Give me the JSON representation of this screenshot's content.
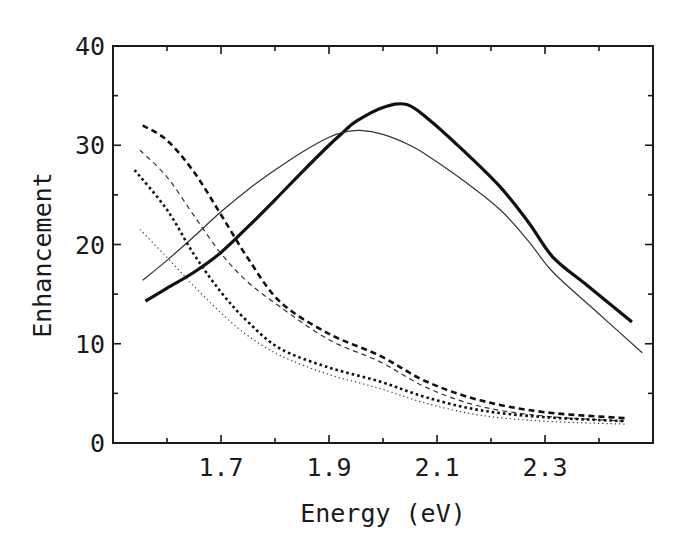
{
  "chart_data": {
    "type": "line",
    "title": "",
    "xlabel": "Energy (eV)",
    "ylabel": "Enhancement",
    "xlim": [
      1.5,
      2.5
    ],
    "ylim": [
      0,
      40
    ],
    "x_ticks_major": [
      1.7,
      1.9,
      2.1,
      2.3
    ],
    "x_tick_labels": [
      "1.7",
      "1.9",
      "2.1",
      "2.3"
    ],
    "x_ticks_minor": [
      1.6,
      1.8,
      2.0,
      2.2,
      2.4
    ],
    "y_ticks_major": [
      0,
      10,
      20,
      30,
      40
    ],
    "y_tick_labels": [
      "0",
      "10",
      "20",
      "30",
      "40"
    ],
    "y_ticks_minor": [
      5,
      15,
      25,
      35
    ],
    "grid": false,
    "legend": null,
    "series": [
      {
        "name": "thick solid",
        "style": "solid",
        "width": 3.2,
        "color": "#111111",
        "x": [
          1.56,
          1.6,
          1.65,
          1.7,
          1.754,
          1.8,
          1.85,
          1.9,
          1.926,
          1.95,
          2.0,
          2.044,
          2.087,
          2.15,
          2.217,
          2.27,
          2.315,
          2.38,
          2.461
        ],
        "y": [
          14.3,
          15.6,
          17.2,
          19.2,
          22.0,
          24.5,
          27.3,
          30.0,
          31.3,
          32.4,
          33.8,
          34.1,
          32.5,
          29.4,
          25.8,
          22.2,
          18.7,
          15.8,
          12.2
        ]
      },
      {
        "name": "thin solid",
        "style": "solid",
        "width": 1.2,
        "color": "#333333",
        "x": [
          1.555,
          1.6,
          1.65,
          1.7,
          1.754,
          1.8,
          1.85,
          1.9,
          1.926,
          1.957,
          2.0,
          2.05,
          2.087,
          2.15,
          2.217,
          2.27,
          2.315,
          2.4,
          2.48
        ],
        "y": [
          16.4,
          18.4,
          20.8,
          23.3,
          25.7,
          27.5,
          29.3,
          30.8,
          31.3,
          31.5,
          31.1,
          30.0,
          28.8,
          26.4,
          23.5,
          20.3,
          17.2,
          13.0,
          9.1
        ]
      },
      {
        "name": "thick dashed",
        "style": "dashed",
        "width": 2.6,
        "color": "#111111",
        "x": [
          1.555,
          1.6,
          1.65,
          1.7,
          1.75,
          1.81,
          1.9,
          1.994,
          2.08,
          2.18,
          2.3,
          2.45
        ],
        "y": [
          32.0,
          30.5,
          27.3,
          23.0,
          18.6,
          14.2,
          11.0,
          8.8,
          6.2,
          4.3,
          3.1,
          2.5
        ]
      },
      {
        "name": "thin dashed",
        "style": "dashed",
        "width": 1.2,
        "color": "#333333",
        "x": [
          1.55,
          1.6,
          1.65,
          1.7,
          1.75,
          1.81,
          1.9,
          1.994,
          2.08,
          2.18,
          2.3,
          2.45
        ],
        "y": [
          29.5,
          26.8,
          22.9,
          19.1,
          16.2,
          13.7,
          10.4,
          8.2,
          5.6,
          3.7,
          2.7,
          2.2
        ]
      },
      {
        "name": "thick dotted",
        "style": "dotted",
        "width": 2.6,
        "color": "#111111",
        "x": [
          1.54,
          1.6,
          1.65,
          1.7,
          1.75,
          1.81,
          1.9,
          1.994,
          2.08,
          2.18,
          2.3,
          2.45
        ],
        "y": [
          27.5,
          23.5,
          19.0,
          15.2,
          12.2,
          9.5,
          7.6,
          6.2,
          4.6,
          3.3,
          2.6,
          2.2
        ]
      },
      {
        "name": "thin dotted",
        "style": "dotted",
        "width": 1.2,
        "color": "#333333",
        "x": [
          1.55,
          1.6,
          1.65,
          1.7,
          1.75,
          1.81,
          1.9,
          1.994,
          2.08,
          2.18,
          2.3,
          2.45
        ],
        "y": [
          21.5,
          18.7,
          15.8,
          13.1,
          10.8,
          8.8,
          6.9,
          5.5,
          4.0,
          2.8,
          2.2,
          1.9
        ]
      }
    ]
  },
  "layout": {
    "plot_left": 113,
    "plot_right": 653,
    "plot_top": 46,
    "plot_bottom": 443
  }
}
